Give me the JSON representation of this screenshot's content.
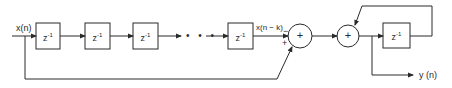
{
  "diagram": {
    "type": "block-diagram",
    "colors": {
      "stroke": "#2a2a2a",
      "background": "#ffffff"
    },
    "input_label": "x(n)",
    "output_label": "y (n)",
    "delay_blocks": [
      {
        "base": "z",
        "exp": "-1"
      },
      {
        "base": "z",
        "exp": "-1"
      },
      {
        "base": "z",
        "exp": "-1"
      },
      {
        "base": "z",
        "exp": "-1"
      }
    ],
    "ellipsis": "• • •",
    "tap_label": "x(n − k)",
    "summer1": {
      "symbol": "+",
      "input_top_sign": "−",
      "input_bottom_sign": "+"
    },
    "summer2": {
      "symbol": "+"
    },
    "feedback_block": {
      "base": "z",
      "exp": "-1"
    }
  }
}
